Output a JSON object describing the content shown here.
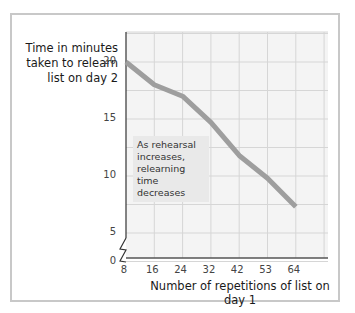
{
  "chart_data": {
    "type": "line",
    "title": "",
    "xlabel": "Number of repetitions of list on day 1",
    "ylabel": "Time in minutes taken to relearn list on day 2",
    "categories": [
      "8",
      "16",
      "24",
      "32",
      "42",
      "53",
      "64"
    ],
    "series": [
      {
        "name": "Relearning time",
        "values": [
          20,
          18,
          17,
          14.7,
          11.8,
          9.8,
          7.3
        ]
      }
    ],
    "y_ticks": [
      "0",
      "5",
      "10",
      "15",
      "20"
    ],
    "ylim": [
      0,
      22.5
    ],
    "y_axis_break": true,
    "grid": true,
    "annotation": "As rehearsal increases, relearning time decreases",
    "line_color": "#9e9e9e",
    "grid_color": "#d6d6d6",
    "plot_bg": "#f4f4f4"
  },
  "labels": {
    "ylabel_line1": "Time in minutes",
    "ylabel_line2": "taken to relearn",
    "ylabel_line3": "list on day 2",
    "xlabel": "Number of repetitions of list on day 1",
    "annotation": "As rehearsal increases, relearning time decreases"
  }
}
